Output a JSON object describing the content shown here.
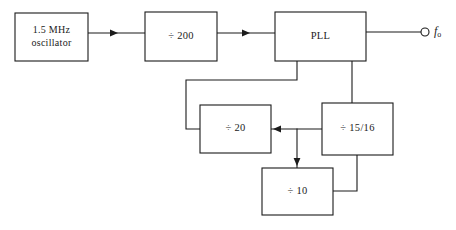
{
  "diagram": {
    "stroke_color": "#1b1b1b",
    "background_color": "#ffffff",
    "blocks": [
      {
        "id": "oscillator",
        "label_line1": "1.5  MHz",
        "label_line2": "oscillator",
        "x": 15,
        "y": 13,
        "w": 73,
        "h": 48
      },
      {
        "id": "divide-200",
        "label": "÷ 200",
        "x": 145,
        "y": 12,
        "w": 72,
        "h": 49
      },
      {
        "id": "pll",
        "label": "PLL",
        "x": 275,
        "y": 12,
        "w": 91,
        "h": 49
      },
      {
        "id": "divide-20",
        "label": "÷ 20",
        "x": 200,
        "y": 105,
        "w": 71,
        "h": 48
      },
      {
        "id": "divide-15-16",
        "label": "÷ 15/16",
        "x": 322,
        "y": 103,
        "w": 71,
        "h": 52
      },
      {
        "id": "divide-10",
        "label": "÷ 10",
        "x": 262,
        "y": 168,
        "w": 71,
        "h": 47
      }
    ],
    "output": {
      "terminal_cx": 425,
      "terminal_cy": 32,
      "terminal_r": 4,
      "symbol": "f",
      "subscript": "o",
      "label_x": 434,
      "label_y": 32
    },
    "wires": [
      {
        "id": "osc-to-div200",
        "points": "88,33 145,33"
      },
      {
        "id": "div200-to-pll",
        "points": "217,33 275,33"
      },
      {
        "id": "pll-to-output",
        "points": "366,32 421,32"
      },
      {
        "id": "pll-feedback-to-div20",
        "points": "297,61 297,80 186,80 186,129 200,129"
      },
      {
        "id": "pll-to-div1516",
        "points": "352,61 352,103"
      },
      {
        "id": "div1516-to-div20",
        "points": "322,129 271,129"
      },
      {
        "id": "div1516-branch-to-div10",
        "points": "297,129 297,168"
      },
      {
        "id": "div10-to-div1516",
        "points": "333,191 357,191 357,155"
      }
    ],
    "arrowheads": [
      {
        "id": "arrow-into-div200",
        "x": 118,
        "y": 33,
        "dir": "right"
      },
      {
        "id": "arrow-into-pll",
        "x": 250,
        "y": 33,
        "dir": "right"
      },
      {
        "id": "arrow-into-div20",
        "x": 273,
        "y": 129,
        "dir": "left"
      },
      {
        "id": "arrow-into-div10",
        "x": 297,
        "y": 166,
        "dir": "down"
      }
    ]
  }
}
